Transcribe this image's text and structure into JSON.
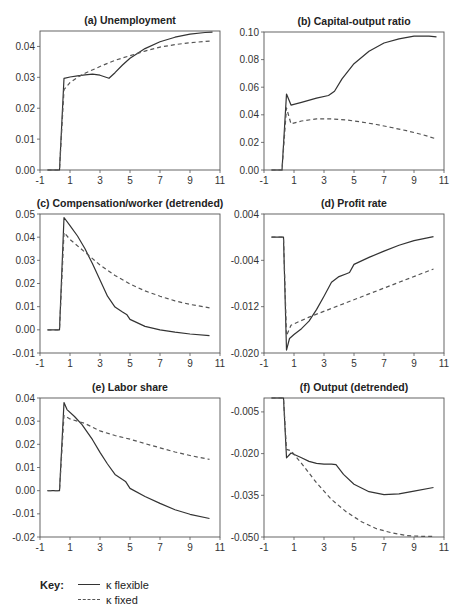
{
  "chart_data": [
    {
      "id": "a",
      "type": "line",
      "title": "(a) Unemployment",
      "xlabel": "",
      "ylabel": "",
      "xlim": [
        -1,
        11
      ],
      "ylim": [
        0,
        0.045
      ],
      "xticks": [
        -1,
        1,
        3,
        5,
        7,
        9,
        11
      ],
      "yticks": [
        0.0,
        0.01,
        0.02,
        0.03,
        0.04
      ],
      "ytick_labels": [
        "0.00",
        "0.01",
        "0.02",
        "0.03",
        "0.04"
      ],
      "grid": false,
      "series": [
        {
          "name": "κ flexible",
          "style": "solid",
          "x": [
            -0.5,
            0.3,
            0.6,
            1,
            1.5,
            2,
            2.5,
            3,
            3.3,
            3.6,
            4,
            4.5,
            5,
            6,
            7,
            8,
            9,
            10,
            10.5
          ],
          "y": [
            0,
            0,
            0.0297,
            0.0301,
            0.0305,
            0.0308,
            0.031,
            0.0307,
            0.0302,
            0.0297,
            0.0315,
            0.034,
            0.0362,
            0.0393,
            0.0415,
            0.043,
            0.044,
            0.0445,
            0.0446
          ]
        },
        {
          "name": "κ fixed",
          "style": "dashed",
          "x": [
            -0.5,
            0.3,
            0.6,
            1,
            1.5,
            2,
            3,
            4,
            5,
            6,
            7,
            8,
            9,
            10,
            10.5
          ],
          "y": [
            0,
            0,
            0.026,
            0.0283,
            0.03,
            0.0313,
            0.0335,
            0.0355,
            0.037,
            0.0385,
            0.0398,
            0.0406,
            0.0412,
            0.0416,
            0.0418
          ]
        }
      ]
    },
    {
      "id": "b",
      "type": "line",
      "title": "(b) Capital-output ratio",
      "xlabel": "",
      "ylabel": "",
      "xlim": [
        -1,
        11
      ],
      "ylim": [
        0,
        0.1
      ],
      "xticks": [
        -1,
        1,
        3,
        5,
        7,
        9,
        11
      ],
      "yticks": [
        0.0,
        0.02,
        0.04,
        0.06,
        0.08,
        0.1
      ],
      "ytick_labels": [
        "0.00",
        "0.02",
        "0.04",
        "0.06",
        "0.08",
        "0.10"
      ],
      "grid": false,
      "series": [
        {
          "name": "κ flexible",
          "style": "solid",
          "x": [
            -0.5,
            0.2,
            0.5,
            0.8,
            1.5,
            2.5,
            3.3,
            3.7,
            4.2,
            5,
            6,
            7,
            8,
            9,
            10,
            10.5
          ],
          "y": [
            0,
            0,
            0.055,
            0.047,
            0.049,
            0.052,
            0.054,
            0.057,
            0.066,
            0.077,
            0.086,
            0.092,
            0.095,
            0.097,
            0.097,
            0.0965
          ]
        },
        {
          "name": "κ fixed",
          "style": "dashed",
          "x": [
            -0.5,
            0.2,
            0.5,
            0.8,
            1.5,
            2.5,
            3.5,
            4.5,
            5.5,
            6.5,
            7.5,
            8.5,
            9.5,
            10.5
          ],
          "y": [
            0,
            0,
            0.045,
            0.0335,
            0.0355,
            0.037,
            0.037,
            0.0362,
            0.0348,
            0.033,
            0.0308,
            0.0285,
            0.0258,
            0.0225
          ]
        }
      ]
    },
    {
      "id": "c",
      "type": "line",
      "title": "(c) Compensation/worker (detrended)",
      "xlabel": "",
      "ylabel": "",
      "xlim": [
        -1,
        11
      ],
      "ylim": [
        -0.01,
        0.05
      ],
      "xticks": [
        -1,
        1,
        3,
        5,
        7,
        9,
        11
      ],
      "yticks": [
        -0.01,
        0.0,
        0.01,
        0.02,
        0.03,
        0.04,
        0.05
      ],
      "ytick_labels": [
        "-0.01",
        "0.00",
        "0.01",
        "0.02",
        "0.03",
        "0.04",
        "0.05"
      ],
      "grid": false,
      "series": [
        {
          "name": "κ flexible",
          "style": "solid",
          "x": [
            -0.5,
            0.3,
            0.6,
            1,
            1.5,
            2,
            2.5,
            3,
            3.5,
            4,
            4.5,
            4.8,
            5,
            6,
            7,
            8,
            9,
            10.3
          ],
          "y": [
            0,
            0,
            0.0485,
            0.045,
            0.0405,
            0.035,
            0.0285,
            0.0215,
            0.0145,
            0.0098,
            0.0077,
            0.0065,
            0.0045,
            0.0015,
            0.0,
            -0.001,
            -0.0018,
            -0.0025
          ]
        },
        {
          "name": "κ fixed",
          "style": "dashed",
          "x": [
            -0.5,
            0.3,
            0.6,
            1,
            2,
            3,
            4,
            5,
            6,
            7,
            8,
            9,
            10.3
          ],
          "y": [
            0,
            0,
            0.042,
            0.039,
            0.0335,
            0.028,
            0.0235,
            0.0198,
            0.0168,
            0.0145,
            0.0125,
            0.011,
            0.0095
          ]
        }
      ]
    },
    {
      "id": "d",
      "type": "line",
      "title": "(d) Profit rate",
      "xlabel": "",
      "ylabel": "",
      "xlim": [
        -1,
        11
      ],
      "ylim": [
        -0.02,
        0.004
      ],
      "xticks": [
        -1,
        1,
        3,
        5,
        7,
        9,
        11
      ],
      "yticks": [
        -0.02,
        -0.012,
        -0.004,
        0.004
      ],
      "ytick_labels": [
        "-0.020",
        "-0.012",
        "-0.004",
        "0.004"
      ],
      "grid": false,
      "series": [
        {
          "name": "κ flexible",
          "style": "solid",
          "x": [
            -0.5,
            0.3,
            0.5,
            0.7,
            1,
            1.5,
            2,
            2.5,
            3,
            3.5,
            4,
            4.5,
            4.7,
            5,
            6,
            7,
            8,
            9,
            10.3
          ],
          "y": [
            0,
            0,
            -0.0195,
            -0.0175,
            -0.0168,
            -0.0158,
            -0.0145,
            -0.0125,
            -0.0102,
            -0.0078,
            -0.0068,
            -0.0063,
            -0.0061,
            -0.0047,
            -0.0035,
            -0.0024,
            -0.0014,
            -0.0006,
            0.0001
          ]
        },
        {
          "name": "κ fixed",
          "style": "dashed",
          "x": [
            -0.5,
            0.3,
            0.5,
            0.8,
            2,
            4,
            6,
            8,
            10.3
          ],
          "y": [
            0,
            0,
            -0.017,
            -0.0152,
            -0.0138,
            -0.0118,
            -0.0098,
            -0.0078,
            -0.0055
          ]
        }
      ]
    },
    {
      "id": "e",
      "type": "line",
      "title": "(e) Labor share",
      "xlabel": "",
      "ylabel": "",
      "xlim": [
        -1,
        11
      ],
      "ylim": [
        -0.02,
        0.04
      ],
      "xticks": [
        -1,
        1,
        3,
        5,
        7,
        9,
        11
      ],
      "yticks": [
        -0.02,
        -0.01,
        0.0,
        0.01,
        0.02,
        0.03,
        0.04
      ],
      "ytick_labels": [
        "-0.02",
        "-0.01",
        "0.00",
        "0.01",
        "0.02",
        "0.03",
        "0.04"
      ],
      "grid": false,
      "series": [
        {
          "name": "κ flexible",
          "style": "solid",
          "x": [
            -0.5,
            0.3,
            0.6,
            0.8,
            1.3,
            1.8,
            2.5,
            3,
            3.5,
            4,
            4.5,
            4.7,
            5,
            6,
            7,
            8,
            9,
            10.3
          ],
          "y": [
            0,
            0,
            0.038,
            0.035,
            0.032,
            0.0285,
            0.022,
            0.0165,
            0.0115,
            0.007,
            0.0048,
            0.004,
            0.001,
            -0.0025,
            -0.0055,
            -0.0082,
            -0.0102,
            -0.012
          ]
        },
        {
          "name": "κ fixed",
          "style": "dashed",
          "x": [
            -0.5,
            0.3,
            0.6,
            1,
            2,
            3,
            4,
            5,
            6,
            7,
            8,
            9,
            10.3
          ],
          "y": [
            0,
            0,
            0.0325,
            0.031,
            0.029,
            0.0258,
            0.0238,
            0.0222,
            0.0203,
            0.0185,
            0.0167,
            0.0152,
            0.0135
          ]
        }
      ]
    },
    {
      "id": "f",
      "type": "line",
      "title": "(f) Output (detrended)",
      "xlabel": "",
      "ylabel": "",
      "xlim": [
        -1,
        11
      ],
      "ylim": [
        -0.05,
        0.0
      ],
      "xticks": [
        -1,
        1,
        3,
        5,
        7,
        9,
        11
      ],
      "yticks": [
        -0.05,
        -0.035,
        -0.02,
        -0.005
      ],
      "ytick_labels": [
        "-0.050",
        "-0.035",
        "-0.020",
        "-0.005"
      ],
      "grid": false,
      "series": [
        {
          "name": "κ flexible",
          "style": "solid",
          "x": [
            -0.5,
            0.3,
            0.5,
            0.8,
            1.5,
            2,
            2.5,
            3,
            3.5,
            3.8,
            4.3,
            5,
            6,
            7,
            8,
            9,
            10.3
          ],
          "y": [
            0,
            0,
            -0.0215,
            -0.0198,
            -0.0215,
            -0.0228,
            -0.0235,
            -0.0238,
            -0.0238,
            -0.024,
            -0.0275,
            -0.031,
            -0.0337,
            -0.0348,
            -0.0345,
            -0.0335,
            -0.0322
          ]
        },
        {
          "name": "κ fixed",
          "style": "dashed",
          "x": [
            -0.5,
            0.3,
            0.5,
            0.8,
            1.5,
            2.5,
            3.5,
            4.5,
            5.5,
            6.5,
            7.5,
            8.5,
            9.5,
            10.3
          ],
          "y": [
            0,
            0,
            -0.0185,
            -0.019,
            -0.0235,
            -0.0305,
            -0.0365,
            -0.041,
            -0.0445,
            -0.047,
            -0.0485,
            -0.0495,
            -0.0498,
            -0.0498
          ]
        }
      ]
    }
  ],
  "key": {
    "label": "Key:",
    "items": [
      {
        "label": "κ flexible",
        "style": "solid"
      },
      {
        "label": "κ fixed",
        "style": "dashed"
      }
    ]
  }
}
